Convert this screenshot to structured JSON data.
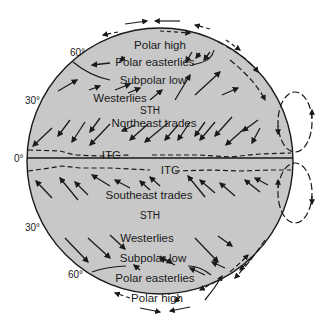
{
  "diagram": {
    "colors": {
      "globe_fill": "#c8c8c8",
      "stroke": "#1a1a1a",
      "background": "#ffffff"
    },
    "latitude_labels": {
      "north_60": "60°",
      "north_30": "30°",
      "equator": "0°",
      "south_30": "30°",
      "south_60": "60°"
    },
    "northern_hemisphere": {
      "polar_high": "Polar high",
      "polar_easterlies": "Polar easterlies",
      "subpolar_low": "Subpolar low",
      "westerlies": "Westerlies",
      "sth": "STH",
      "trades": "Northeast trades",
      "itc": "ITC"
    },
    "southern_hemisphere": {
      "itc": "ITC",
      "trades": "Southeast trades",
      "sth": "STH",
      "westerlies": "Westerlies",
      "subpolar_low": "Subpolar low",
      "polar_easterlies": "Polar easterlies",
      "polar_high": "Polar high"
    }
  }
}
